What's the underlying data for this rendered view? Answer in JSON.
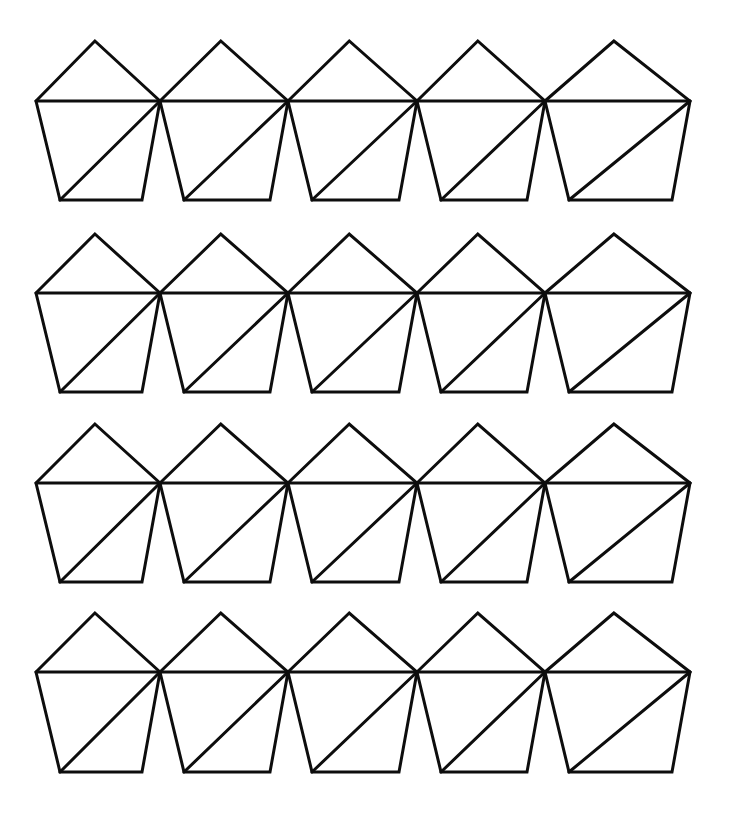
{
  "figure": {
    "background_color": "#ffffff",
    "stroke_color": "#0d0d0d",
    "stroke_width": 3,
    "canvas": {
      "width": 729,
      "height": 815
    },
    "rows": 4,
    "columns": 5,
    "shape_count": 20
  },
  "geometry": {
    "origin_x": 36,
    "row_tops": [
      41,
      234,
      424,
      613
    ],
    "row_mid_offset": 60,
    "row_bottom_offset": 160,
    "cell_width": 128.5,
    "apex_offset_x": 61,
    "bottom_left_inset": 24,
    "bottom_right_inset": 18,
    "pentagon": {
      "vertices_order": [
        "left",
        "apex",
        "right",
        "bottom_right",
        "bottom_left"
      ],
      "internal_edges": [
        "left-to-right-chord",
        "right-to-bottom-left-diagonal"
      ]
    }
  },
  "chart_data": {
    "type": "diagram",
    "rows": 4,
    "columns": 5,
    "total_shapes": 20,
    "shape": "pentagon",
    "triangles_per_shape": 3,
    "row_y_apex": [
      41,
      234,
      424,
      613
    ],
    "row_y_chord": [
      101,
      293,
      483,
      672
    ],
    "row_y_base": [
      200,
      392,
      582,
      772
    ],
    "shared_vertex_x": [
      36,
      160,
      288,
      417,
      545,
      690
    ]
  }
}
